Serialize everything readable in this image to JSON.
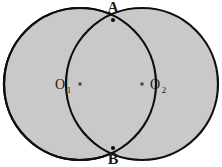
{
  "figure": {
    "type": "geometry-diagram",
    "background_color": "#ffffff",
    "canvas": {
      "width": 222,
      "height": 167
    }
  },
  "style": {
    "fill_color": "#c9c9c9",
    "stroke_color": "#0d0d0d",
    "stroke_width": 2.2,
    "point_marker_color": "#4a4a4a",
    "label_color": "#1a1a1a"
  },
  "shapes": {
    "circle_left": {
      "name": "circle-O1",
      "cx": 80,
      "cy": 84,
      "r": 76
    },
    "circle_right": {
      "name": "circle-O2",
      "cx": 142,
      "cy": 84,
      "r": 76
    }
  },
  "points": {
    "A": {
      "label": "A",
      "x": 113,
      "y": 20,
      "label_x": 113,
      "label_y": 13
    },
    "B": {
      "label": "B",
      "x": 113,
      "y": 148,
      "label_x": 113,
      "label_y": 164
    },
    "O1": {
      "label": "O",
      "subscript": "1",
      "x": 80,
      "y": 84,
      "label_x": 60,
      "label_y": 89
    },
    "O2": {
      "label": "O",
      "subscript": "2",
      "x": 142,
      "y": 84,
      "label_x": 149,
      "label_y": 89
    }
  },
  "labels": {
    "point_a": "A",
    "point_b": "B",
    "center_one_base": "O",
    "center_one_sub": "1",
    "center_two_base": "O",
    "center_two_sub": "2"
  }
}
